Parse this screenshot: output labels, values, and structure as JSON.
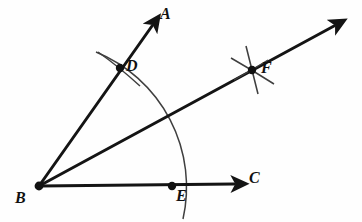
{
  "figure": {
    "background_color": "#fefefe",
    "stroke_color": "#141414",
    "arc_color": "#3a3a3a"
  },
  "labels": {
    "a": "A",
    "b": "B",
    "c": "C",
    "d": "D",
    "e": "E",
    "f": "F"
  },
  "points": {
    "B": {
      "name": "B",
      "x": 39,
      "y": 186,
      "role": "vertex"
    },
    "D": {
      "name": "D",
      "x": 120,
      "y": 68,
      "role": "arc-intersection-on-ray-BA"
    },
    "E": {
      "name": "E",
      "x": 172,
      "y": 186,
      "role": "arc-intersection-on-ray-BC"
    },
    "F": {
      "name": "F",
      "x": 252,
      "y": 70,
      "role": "bisector-arc-intersection"
    },
    "A_tip": {
      "name": "A",
      "x": 155,
      "y": 22,
      "role": "ray-arrow-tip"
    },
    "C_tip": {
      "name": "C",
      "x": 240,
      "y": 183,
      "role": "ray-arrow-tip"
    },
    "F_tip": {
      "name": "",
      "x": 338,
      "y": 22,
      "role": "bisector-arrow-tip"
    }
  },
  "label_positions": {
    "a": {
      "x": 160,
      "y": 6
    },
    "b": {
      "x": 15,
      "y": 190
    },
    "c": {
      "x": 249,
      "y": 170
    },
    "d": {
      "x": 126,
      "y": 58
    },
    "e": {
      "x": 176,
      "y": 188
    },
    "f": {
      "x": 261,
      "y": 60
    }
  },
  "rays": [
    {
      "name": "ray-BA",
      "from": "B",
      "to": "A_tip",
      "arrow": true
    },
    {
      "name": "ray-BC",
      "from": "B",
      "to": "C_tip",
      "arrow": true
    },
    {
      "name": "ray-BF-bisector",
      "from": "B",
      "to": "F_tip",
      "arrow": true
    }
  ],
  "arcs": [
    {
      "name": "main-compass-arc",
      "center": "B",
      "radius": 146,
      "description": "arc centered at B crossing ray BA at D and ray BC at E"
    },
    {
      "name": "tick-arc-at-D",
      "through": "D",
      "description": "short crossing arc mark at D"
    },
    {
      "name": "tick-arc-at-E",
      "through": "E",
      "description": "short crossing arc mark at E"
    },
    {
      "name": "cross-arc-1-at-F",
      "through": "F",
      "description": "arc from D used to locate F"
    },
    {
      "name": "cross-arc-2-at-F",
      "through": "F",
      "description": "arc from E used to locate F"
    }
  ]
}
